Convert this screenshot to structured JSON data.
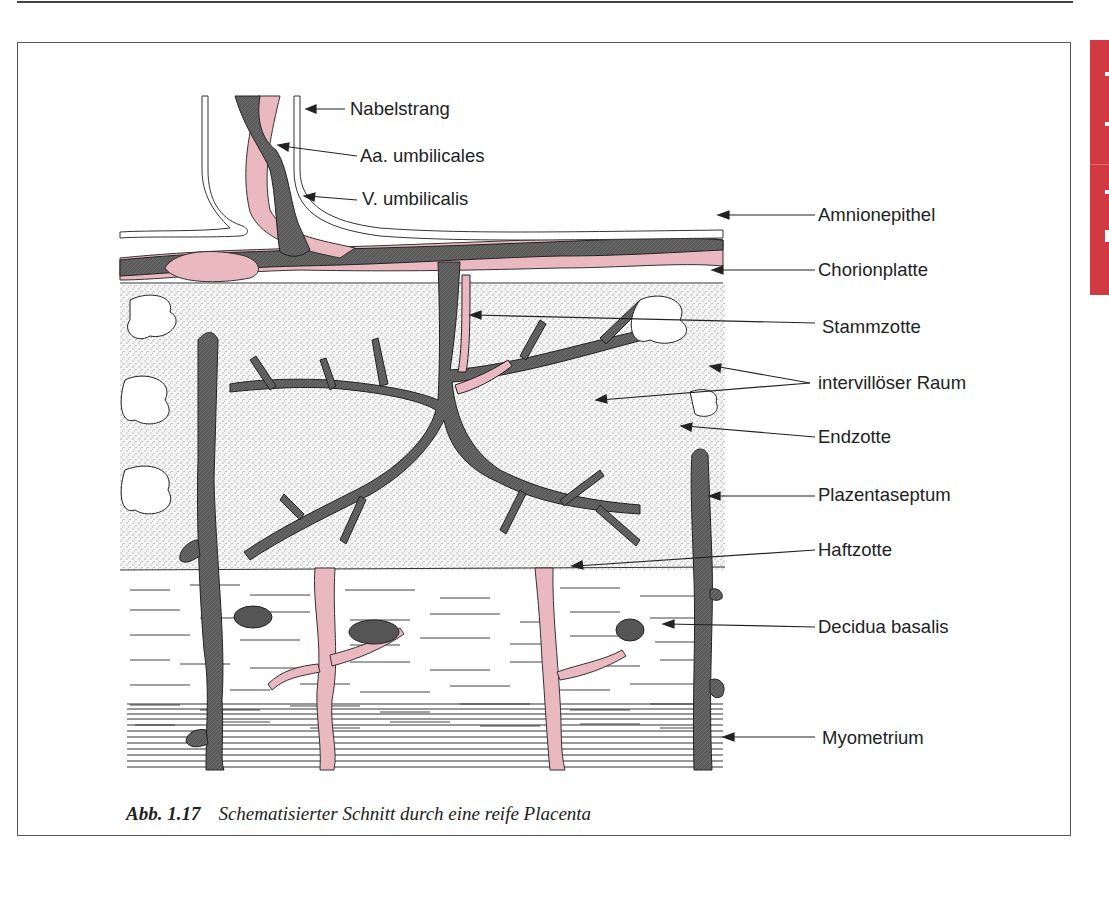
{
  "page": {
    "side_tab_color": "#d13a43"
  },
  "figure": {
    "number": "Abb. 1.17",
    "caption": "Schematisierter Schnitt durch eine reife Placenta",
    "colors": {
      "villous_tissue": "#5a5a5a",
      "artery_pink": "#eab8bf",
      "stipple_bg": "#f3f3f3",
      "outline": "#222222"
    },
    "labels": [
      {
        "id": "nabelstrang",
        "text": "Nabelstrang"
      },
      {
        "id": "aa-umbilicales",
        "text": "Aa. umbilicales"
      },
      {
        "id": "v-umbilicalis",
        "text": "V. umbilicalis"
      },
      {
        "id": "amnionepithel",
        "text": "Amnionepithel"
      },
      {
        "id": "chorionplatte",
        "text": "Chorionplatte"
      },
      {
        "id": "stammzotte",
        "text": "Stammzotte"
      },
      {
        "id": "intervilloeser-raum",
        "text": "intervillöser Raum"
      },
      {
        "id": "endzotte",
        "text": "Endzotte"
      },
      {
        "id": "plazentaseptum",
        "text": "Plazentaseptum"
      },
      {
        "id": "haftzotte",
        "text": "Haftzotte"
      },
      {
        "id": "decidua-basalis",
        "text": "Decidua basalis"
      },
      {
        "id": "myometrium",
        "text": "Myometrium"
      }
    ]
  }
}
